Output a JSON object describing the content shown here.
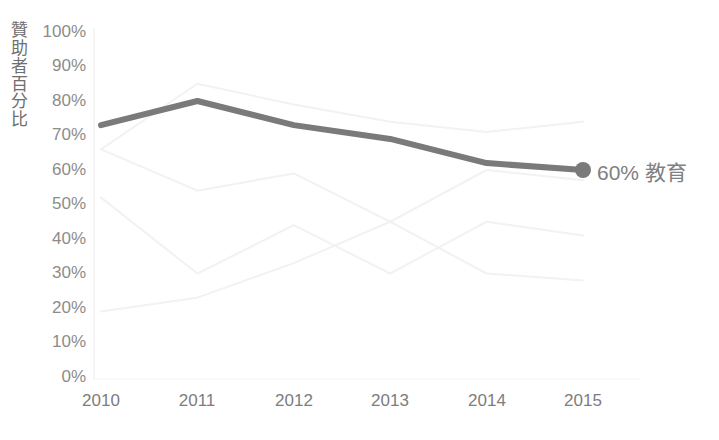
{
  "chart_data": {
    "type": "line",
    "title": "",
    "subtitle": "",
    "xlabel": "",
    "ylabel": "贊助者百分比",
    "categories": [
      "2010",
      "2011",
      "2012",
      "2013",
      "2014",
      "2015"
    ],
    "ylim": [
      0,
      100
    ],
    "y_ticks": [
      100,
      90,
      80,
      70,
      60,
      50,
      40,
      30,
      20,
      10,
      0
    ],
    "y_tick_labels": [
      "100%",
      "90%",
      "80%",
      "70%",
      "60%",
      "50%",
      "40%",
      "30%",
      "20%",
      "10%",
      "0%"
    ],
    "grid": false,
    "legend_position": "end-of-line",
    "highlight_series": "教育",
    "series": [
      {
        "name": "教育",
        "values": [
          73,
          80,
          73,
          69,
          62,
          60
        ],
        "color": "#7a7a7a",
        "emphasis": "highlighted",
        "end_marker": true,
        "end_label": "60% 教育"
      },
      {
        "name": "faded-series-1",
        "values": [
          66,
          85,
          79,
          74,
          71,
          74
        ],
        "color": "#f2f2f2",
        "emphasis": "faded",
        "end_marker": false,
        "end_label": ""
      },
      {
        "name": "faded-series-2",
        "values": [
          66,
          54,
          59,
          45,
          60,
          57
        ],
        "color": "#f2f2f2",
        "emphasis": "faded",
        "end_marker": false,
        "end_label": ""
      },
      {
        "name": "faded-series-3",
        "values": [
          52,
          30,
          44,
          30,
          45,
          41
        ],
        "color": "#f2f2f2",
        "emphasis": "faded",
        "end_marker": false,
        "end_label": ""
      },
      {
        "name": "faded-series-4",
        "values": [
          19,
          23,
          33,
          45,
          30,
          28
        ],
        "color": "#f2f2f2",
        "emphasis": "faded",
        "end_marker": false,
        "end_label": ""
      }
    ],
    "annotations": [
      {
        "text": "60% 教育",
        "series": "教育",
        "x": "2015",
        "y": 60
      }
    ]
  },
  "axis": {
    "y_title": "贊助者百分比",
    "y_labels": [
      "100%",
      "90%",
      "80%",
      "70%",
      "60%",
      "50%",
      "40%",
      "30%",
      "20%",
      "10%",
      "0%"
    ],
    "x_labels": [
      "2010",
      "2011",
      "2012",
      "2013",
      "2014",
      "2015"
    ]
  },
  "colors": {
    "highlight_line": "#7a7a7a",
    "faded_line": "#f2f2f2",
    "axis_text": "#8c8c8c",
    "axis_line": "#e8e8e8",
    "background": "#ffffff",
    "label_text": "#808080"
  },
  "label": {
    "end_label": "60% 教育"
  }
}
